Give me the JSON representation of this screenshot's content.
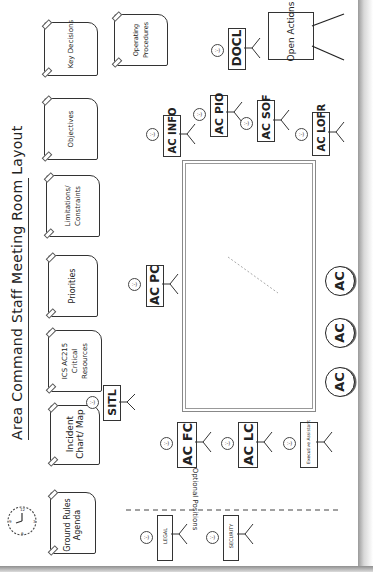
{
  "title": "Area Command Staff Meeting Room Layout",
  "wall_charts": [
    {
      "id": "ground-rules",
      "label": "Ground Rules Agenda"
    },
    {
      "id": "incident-chart",
      "label": "Incident Chart/ Map"
    },
    {
      "id": "ics-ac215",
      "label": "ICS AC215 Critical Resources"
    },
    {
      "id": "priorities",
      "label": "Priorities"
    },
    {
      "id": "limitations",
      "label": "Limitations/ Constraints"
    },
    {
      "id": "objectives",
      "label": "Objectives"
    },
    {
      "id": "key-decisions",
      "label": "Key Decisions"
    },
    {
      "id": "operating-procedures",
      "label": "Operating Procedures"
    }
  ],
  "easel": {
    "label": "Open Actions"
  },
  "positions": [
    {
      "id": "sitl",
      "label": "SITL"
    },
    {
      "id": "ac-pc",
      "label": "AC PC"
    },
    {
      "id": "ac-info",
      "label": "AC INFO"
    },
    {
      "id": "ac-pio",
      "label": "AC PIO"
    },
    {
      "id": "ac-sof",
      "label": "AC SOF"
    },
    {
      "id": "ac-lofr",
      "label": "AC LOFR"
    },
    {
      "id": "docl",
      "label": "DOCL"
    },
    {
      "id": "ac-fc",
      "label": "AC FC"
    },
    {
      "id": "ac-lc",
      "label": "AC LC"
    },
    {
      "id": "executive-assistant",
      "label": "Executive Assistant"
    },
    {
      "id": "legal",
      "label": "LEGAL"
    },
    {
      "id": "security",
      "label": "SECURITY"
    }
  ],
  "area_commanders": [
    "AC",
    "AC",
    "AC"
  ],
  "optional_label": "Optional Positions",
  "clock": {
    "label": "clock"
  }
}
